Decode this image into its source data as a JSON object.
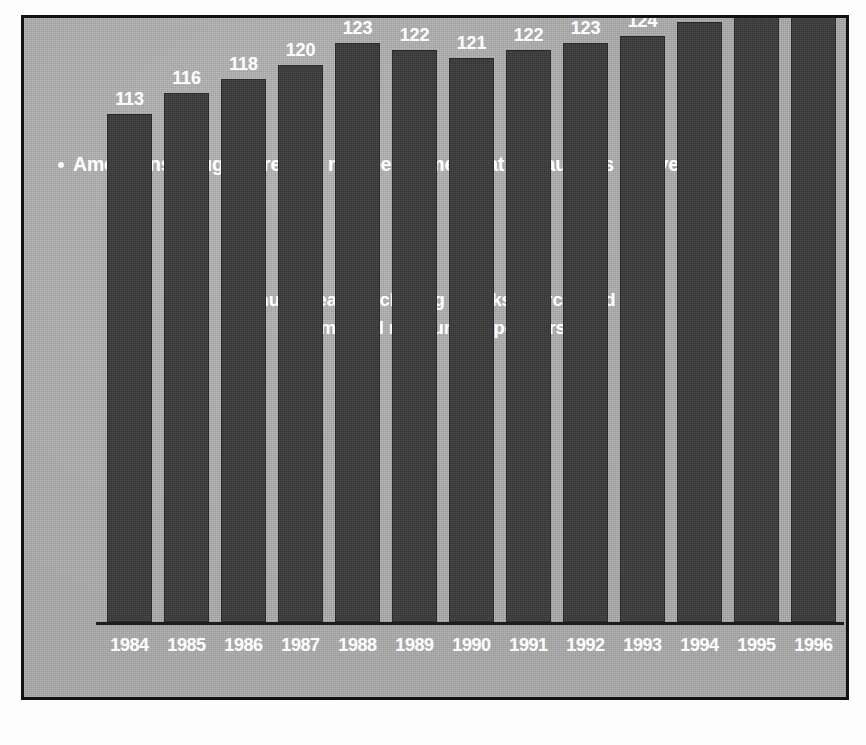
{
  "slide": {
    "bullet": {
      "marker": "bullet-dot",
      "text": "Americans bought a record number of meals at restaurants last year."
    },
    "chart_title_line1": "Annual meals (including snacks) purchased at",
    "chart_title_line2": "commercial restaurants per person"
  },
  "colors": {
    "background": "#b1b1b1",
    "bar": "#3b3b3b",
    "text": "#fcfcfc",
    "border": "#121212",
    "axis": "#1d1d1d"
  },
  "chart_data": {
    "type": "bar",
    "title": "Annual meals (including snacks) purchased at commercial restaurants per person",
    "xlabel": "",
    "ylabel": "",
    "categories": [
      "1984",
      "1985",
      "1986",
      "1987",
      "1988",
      "1989",
      "1990",
      "1991",
      "1992",
      "1993",
      "1994",
      "1995",
      "1996"
    ],
    "values": [
      113,
      116,
      118,
      120,
      123,
      122,
      121,
      122,
      123,
      124,
      126,
      130,
      131
    ],
    "value_labels": [
      "113",
      "116",
      "118",
      "120",
      "123",
      "122",
      "121",
      "122",
      "123",
      "124",
      "126",
      "130",
      "131"
    ],
    "ylim": [
      41.5,
      149
    ],
    "grid": false,
    "legend": false,
    "axis_baseline_visible": true,
    "value_labels_visible": true
  },
  "layout": {
    "plot_left": 83,
    "bar_pitch": 57,
    "bar_width": 45,
    "baseline_y": 604,
    "px_per_unit": 7.1,
    "baseline_value": 41.5,
    "axis_x_start": 72,
    "axis_x_end": 820,
    "value_label_gap": 4,
    "tick_label_y": 617
  }
}
